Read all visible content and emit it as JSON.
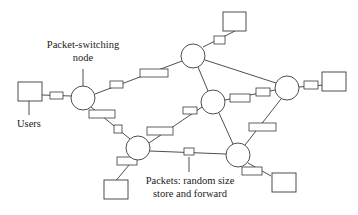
{
  "diagram": {
    "type": "packet-switching network",
    "labels": {
      "node_line1": "Packet-switching",
      "node_line2": "node",
      "users": "Users",
      "packets_line1": "Packets: random size",
      "packets_line2": "store and forward"
    },
    "nodes": [
      {
        "id": "A",
        "cx": 83,
        "cy": 98,
        "r": 12
      },
      {
        "id": "B",
        "cx": 193,
        "cy": 56,
        "r": 12
      },
      {
        "id": "C",
        "cx": 213,
        "cy": 102,
        "r": 12
      },
      {
        "id": "D",
        "cx": 287,
        "cy": 88,
        "r": 12
      },
      {
        "id": "E",
        "cx": 138,
        "cy": 148,
        "r": 12
      },
      {
        "id": "F",
        "cx": 238,
        "cy": 155,
        "r": 12
      }
    ],
    "links": [
      [
        "A",
        "B"
      ],
      [
        "A",
        "E"
      ],
      [
        "B",
        "C"
      ],
      [
        "B",
        "D"
      ],
      [
        "C",
        "D"
      ],
      [
        "C",
        "E"
      ],
      [
        "C",
        "F"
      ],
      [
        "D",
        "F"
      ],
      [
        "E",
        "F"
      ]
    ],
    "users": [
      {
        "id": "U1",
        "attached_to": "A"
      },
      {
        "id": "U2",
        "attached_to": "B"
      },
      {
        "id": "U3",
        "attached_to": "D"
      },
      {
        "id": "U4",
        "attached_to": "E"
      },
      {
        "id": "U5",
        "attached_to": "F"
      }
    ],
    "colors": {
      "stroke": "#3a3a3a",
      "background": "#ffffff",
      "text": "#222222"
    }
  }
}
